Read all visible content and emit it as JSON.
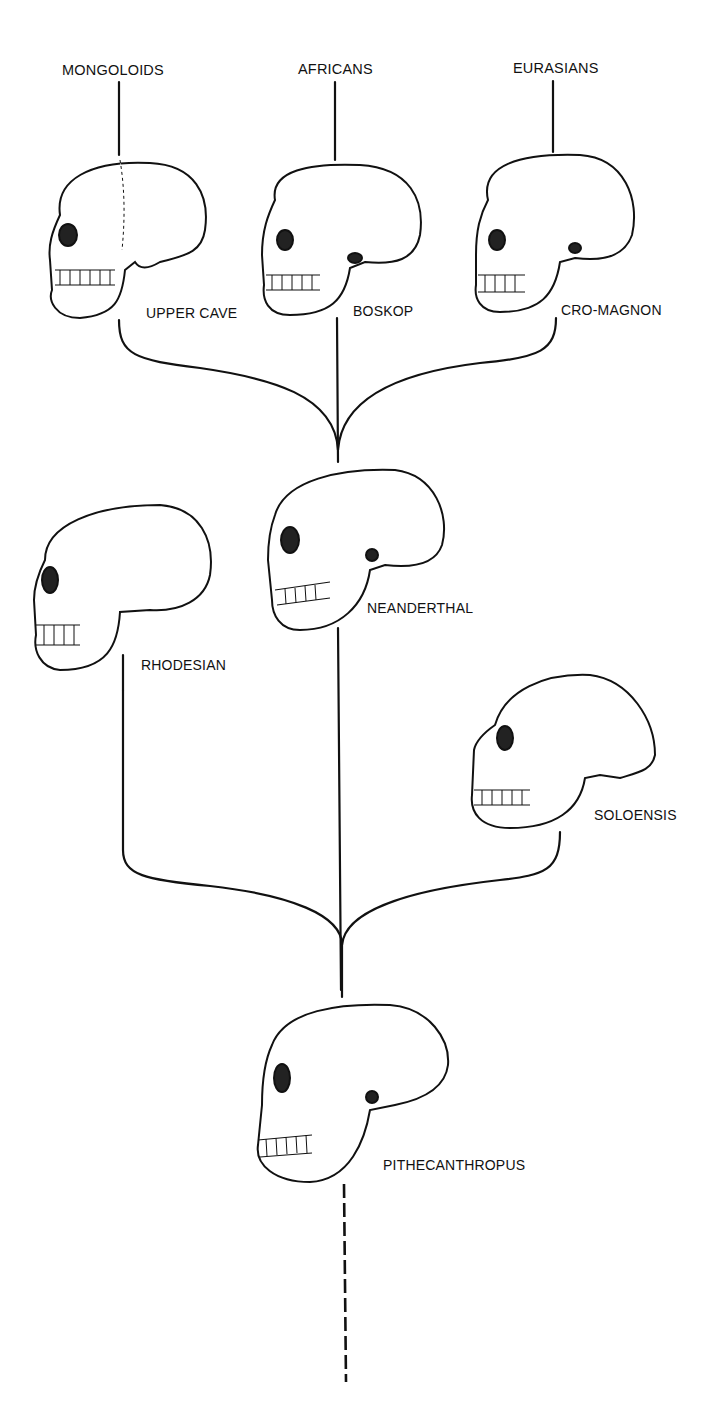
{
  "diagram": {
    "type": "phylogenetic-tree",
    "top_groups": [
      {
        "label": "MONGOLOIDS"
      },
      {
        "label": "AFRICANS"
      },
      {
        "label": "EURASIANS"
      }
    ],
    "nodes": [
      {
        "id": "upper-cave",
        "label": "UPPER CAVE",
        "leads_to": "MONGOLOIDS"
      },
      {
        "id": "boskop",
        "label": "BOSKOP",
        "leads_to": "AFRICANS"
      },
      {
        "id": "cro-magnon",
        "label": "CRO-MAGNON",
        "leads_to": "EURASIANS"
      },
      {
        "id": "rhodesian",
        "label": "RHODESIAN",
        "leads_to": "UPPER CAVE"
      },
      {
        "id": "neanderthal",
        "label": "NEANDERTHAL",
        "leads_to": "BOSKOP"
      },
      {
        "id": "soloensis",
        "label": "SOLOENSIS",
        "leads_to": "CRO-MAGNON"
      },
      {
        "id": "pithecanthropus",
        "label": "PITHECANTHROPUS",
        "leads_to": "RHODESIAN, NEANDERTHAL, SOLOENSIS"
      }
    ],
    "colors": {
      "ink": "#111111",
      "background": "#ffffff"
    }
  }
}
